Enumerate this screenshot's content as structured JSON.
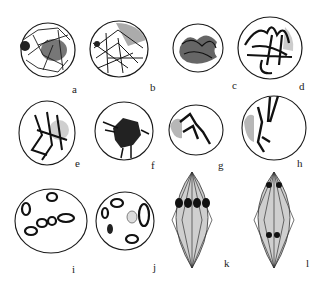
{
  "figure": {
    "colors": {
      "ink": "#1a1a1a",
      "shade": "#9a9a9a",
      "background": "#ffffff"
    },
    "panels": [
      {
        "id": "a",
        "label": "a",
        "stage": "leptotene"
      },
      {
        "id": "b",
        "label": "b",
        "stage": "leptotene/zygotene"
      },
      {
        "id": "c",
        "label": "c",
        "stage": "zygotene (synizesis)"
      },
      {
        "id": "d",
        "label": "d",
        "stage": "pachytene"
      },
      {
        "id": "e",
        "label": "e",
        "stage": "diplotene"
      },
      {
        "id": "f",
        "label": "f",
        "stage": "diplotene (contracted)"
      },
      {
        "id": "g",
        "label": "g",
        "stage": "diplotene"
      },
      {
        "id": "h",
        "label": "h",
        "stage": "diplotene"
      },
      {
        "id": "i",
        "label": "i",
        "stage": "diakinesis"
      },
      {
        "id": "j",
        "label": "j",
        "stage": "diakinesis"
      },
      {
        "id": "k",
        "label": "k",
        "stage": "metaphase I"
      },
      {
        "id": "l",
        "label": "l",
        "stage": "anaphase I"
      }
    ]
  }
}
